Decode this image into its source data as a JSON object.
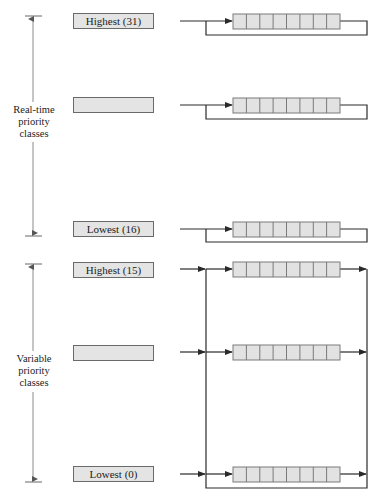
{
  "diagram": {
    "groups": [
      {
        "label_lines": [
          "Real-time",
          "priority",
          "classes"
        ],
        "levels": [
          {
            "label": "Highest (31)"
          },
          {
            "label": ""
          },
          {
            "label": "Lowest (16)"
          }
        ],
        "queue_behavior": "round-robin loop back to same queue"
      },
      {
        "label_lines": [
          "Variable",
          "priority",
          "classes"
        ],
        "levels": [
          {
            "label": "Highest (15)"
          },
          {
            "label": ""
          },
          {
            "label": "Lowest (0)"
          }
        ],
        "queue_behavior": "shared feedback bus between levels"
      }
    ],
    "queue_cells": 8,
    "colors": {
      "line": "#2a2a2a",
      "box_fill": "#e4e4e4",
      "box_border": "#6a6a6a",
      "cell_fill": "#e2e2e2",
      "cell_border": "#7a7a7a",
      "axis_line": "#8a8a8a"
    }
  }
}
